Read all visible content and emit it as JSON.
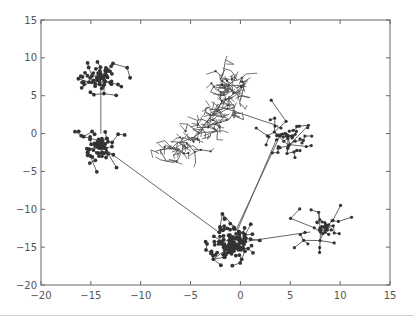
{
  "chart_data": {
    "type": "scatter",
    "subtype": "network-graph",
    "title": "",
    "xlabel": "",
    "ylabel": "",
    "xlim": [
      -20,
      15
    ],
    "ylim": [
      -20,
      15
    ],
    "xticks": [
      -20,
      -15,
      -10,
      -5,
      0,
      5,
      10,
      15
    ],
    "yticks": [
      15,
      10,
      5,
      0,
      -5,
      -10,
      -15,
      -20
    ],
    "grid": false,
    "legend": null,
    "colors": {
      "node": "#333333",
      "edge": "#555555",
      "tree_edge": "#555555",
      "axes": "#666666"
    },
    "clusters": [
      {
        "name": "cluster-a",
        "style": "dense-star",
        "center": [
          -14,
          7.5
        ],
        "radius": 2.6,
        "nodes": 70,
        "seed": 11
      },
      {
        "name": "cluster-b",
        "style": "dense-star",
        "center": [
          -14,
          -1.5
        ],
        "radius": 2.6,
        "nodes": 80,
        "seed": 23
      },
      {
        "name": "cluster-c",
        "style": "dense-star",
        "center": [
          -1,
          -14.5
        ],
        "radius": 3.0,
        "nodes": 160,
        "seed": 37
      },
      {
        "name": "cluster-d",
        "style": "sparse-star",
        "center": [
          4.8,
          -0.3
        ],
        "radius": 2.6,
        "nodes": 60,
        "seed": 51
      },
      {
        "name": "cluster-e",
        "style": "sparse-star",
        "center": [
          8.5,
          -12.5
        ],
        "radius": 2.6,
        "nodes": 55,
        "seed": 67
      },
      {
        "name": "tree",
        "style": "branching-tree",
        "path": [
          [
            -7.5,
            -2.8
          ],
          [
            -5,
            -1.2
          ],
          [
            -3,
            1.5
          ],
          [
            -1.5,
            3.2
          ],
          [
            -1,
            5.5
          ],
          [
            -1.2,
            7.5
          ]
        ],
        "nodes": 220,
        "seed": 83
      }
    ],
    "edges": [
      {
        "from": [
          -14,
          6.0
        ],
        "to": [
          -14,
          0.0
        ]
      },
      {
        "from": [
          -13.2,
          -2.4
        ],
        "to": [
          -2.0,
          -13.2
        ]
      },
      {
        "from": [
          -0.3,
          -12.8
        ],
        "to": [
          3.6,
          -0.8
        ]
      },
      {
        "from": [
          -0.5,
          -12.9
        ],
        "to": [
          3.9,
          -0.5
        ]
      },
      {
        "from": [
          0.8,
          -14.2
        ],
        "to": [
          7.0,
          -13.0
        ]
      },
      {
        "from": [
          -1.2,
          3.2
        ],
        "to": [
          3.8,
          1.0
        ]
      }
    ]
  }
}
